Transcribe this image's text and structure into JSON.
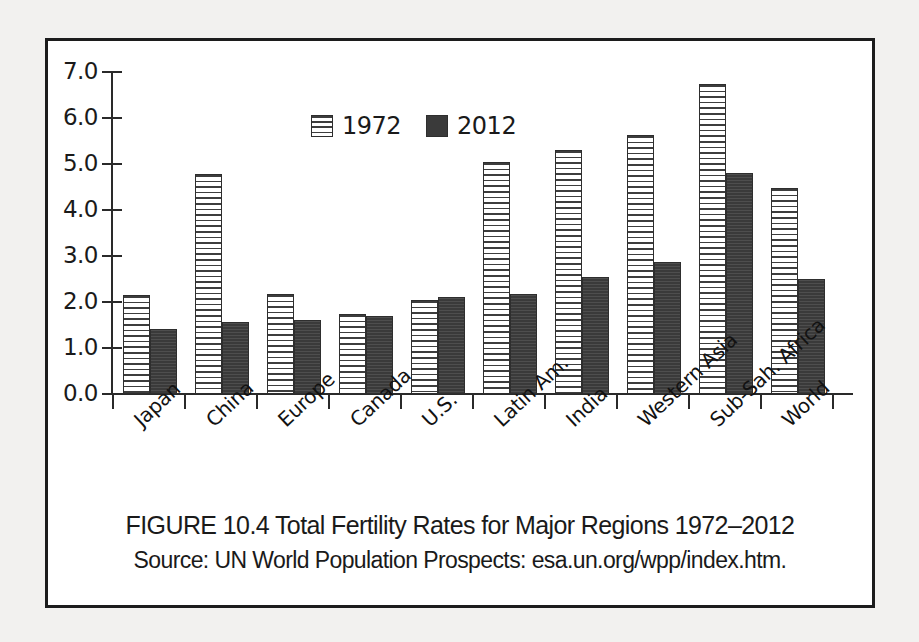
{
  "chart_data": {
    "type": "bar",
    "title": "FIGURE 10.4 Total Fertility Rates for Major Regions 1972–2012",
    "source": "Source: UN World Population Prospects: esa.un.org/wpp/index.htm.",
    "xlabel": "",
    "ylabel": "",
    "ylim": [
      0,
      7
    ],
    "ytick_labels": [
      "7.0",
      "6.0",
      "5.0",
      "4.0",
      "3.0",
      "2.0",
      "1.0",
      "0.0"
    ],
    "ytick_values": [
      7,
      6,
      5,
      4,
      3,
      2,
      1,
      0
    ],
    "grid": false,
    "legend_position": "top-left-inside",
    "categories": [
      "Japan",
      "China",
      "Europe",
      "Canada",
      "U.S.",
      "Latin Am.",
      "India",
      "Western Asia",
      "Sub-Sah. Africa",
      "World"
    ],
    "series": [
      {
        "name": "1972",
        "color": "#ffffff",
        "pattern": "horizontal-stripes",
        "values": [
          2.15,
          4.78,
          2.18,
          1.75,
          2.05,
          5.05,
          5.3,
          5.62,
          6.75,
          4.48
        ]
      },
      {
        "name": "2012",
        "color": "#3a3a3a",
        "pattern": "solid-dark",
        "values": [
          1.42,
          1.57,
          1.6,
          1.7,
          2.1,
          2.18,
          2.55,
          2.87,
          4.8,
          2.5
        ]
      }
    ]
  }
}
